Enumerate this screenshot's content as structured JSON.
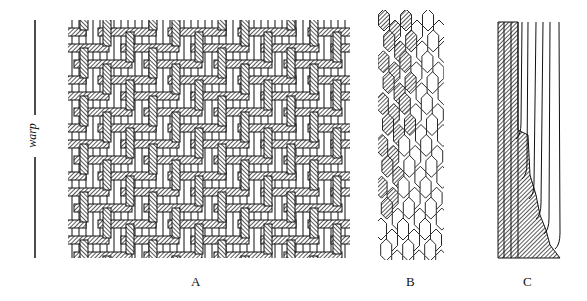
{
  "figure": {
    "axis_label": "warp",
    "panels": [
      {
        "id": "A",
        "label": "A",
        "description": "woven grid with hatched warp and weft threads"
      },
      {
        "id": "B",
        "label": "B",
        "description": "hexagonal cells, hatched on left transitioning to open cells"
      },
      {
        "id": "C",
        "label": "C",
        "description": "vertical fibres, hatched region growing toward bottom"
      }
    ],
    "colors": {
      "ink": "#111111",
      "paper": "#ffffff"
    }
  }
}
